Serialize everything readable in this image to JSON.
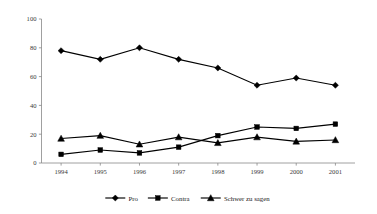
{
  "chart_data": {
    "type": "line",
    "title": "",
    "subtitle": "",
    "xlabel": "",
    "ylabel": "",
    "categories": [
      "1994",
      "1995",
      "1996",
      "1997",
      "1998",
      "1999",
      "2000",
      "2001"
    ],
    "series": [
      {
        "name": "Pro",
        "marker": "diamond",
        "color": "#000000",
        "values": [
          78,
          72,
          80,
          72,
          66,
          54,
          59,
          54
        ]
      },
      {
        "name": "Contra",
        "marker": "square",
        "color": "#000000",
        "values": [
          6,
          9,
          7,
          11,
          19,
          25,
          24,
          27
        ]
      },
      {
        "name": "Schwer zu sagen",
        "marker": "triangle",
        "color": "#000000",
        "values": [
          17,
          19,
          13,
          18,
          14,
          18,
          15,
          16
        ]
      }
    ],
    "ylim": [
      0,
      100
    ],
    "yticks": [
      0,
      20,
      40,
      60,
      80,
      100
    ],
    "ytick_labels": [
      "0",
      "20",
      "40",
      "60",
      "80",
      "100"
    ],
    "grid": false,
    "legend_position": "bottom",
    "axis_color": "#888888"
  },
  "legend": {
    "items": [
      {
        "label": "Pro",
        "marker": "diamond"
      },
      {
        "label": "Contra",
        "marker": "square"
      },
      {
        "label": "Schwer zu sagen",
        "marker": "triangle"
      }
    ]
  }
}
